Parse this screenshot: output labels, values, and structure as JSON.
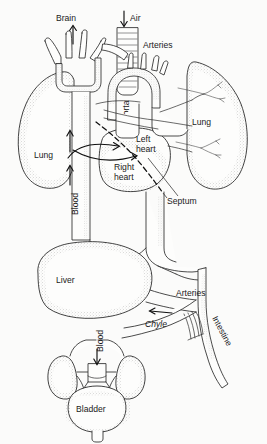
{
  "figure": {
    "kind": "anatomical-diagram",
    "background_color": "#fbfbfa",
    "ink_color": "#2b2b2b"
  },
  "labels": {
    "brain": "Brain",
    "air": "Air",
    "arteries_top": "Arteries",
    "aorta": "Aorta",
    "lung_left": "Lung",
    "lung_right": "Lung",
    "left_heart_line1": "Left",
    "left_heart_line2": "heart",
    "right_heart_line1": "Right",
    "right_heart_line2": "heart",
    "septum": "Septum",
    "blood_upper": "Blood",
    "blood_lower": "Blood",
    "liver": "Liver",
    "arteries_lower": "Arteries",
    "chyle": "Chyle",
    "intestine": "Intestine",
    "bladder": "Bladder"
  },
  "arrows": [
    {
      "name": "brain-arrow",
      "direction": "up",
      "label": "Brain"
    },
    {
      "name": "air-arrow",
      "direction": "down",
      "label": "Air"
    },
    {
      "name": "blood-arrow-upper-a",
      "direction": "up",
      "label": "Blood"
    },
    {
      "name": "blood-arrow-upper-b",
      "direction": "up",
      "label": "Blood"
    },
    {
      "name": "blood-arrow-lower",
      "direction": "down",
      "label": "Blood"
    },
    {
      "name": "chyle-arrow",
      "direction": "left",
      "label": "Chyle"
    },
    {
      "name": "flow-arrow-to-left-heart",
      "direction": "right",
      "label": ""
    },
    {
      "name": "flow-arrow-to-right-heart",
      "direction": "right",
      "label": ""
    }
  ],
  "structures": [
    "trachea",
    "aortic-arch",
    "left-lung",
    "right-lung",
    "heart",
    "septum",
    "vena-cava",
    "liver",
    "kidney-left",
    "kidney-right",
    "bladder",
    "intestine",
    "lymphatic-duct"
  ]
}
